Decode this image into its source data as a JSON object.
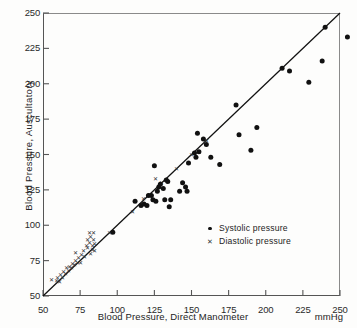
{
  "chart_data": {
    "type": "scatter",
    "title": "",
    "xlabel": "Blood Pressure, Direct Manometer",
    "ylabel": "Blood Pressure, Auscultatory",
    "units": "mmHg",
    "xlim": [
      50,
      250
    ],
    "ylim": [
      50,
      250
    ],
    "xticks": [
      50,
      75,
      100,
      125,
      150,
      175,
      200,
      225,
      250
    ],
    "yticks": [
      50,
      75,
      100,
      125,
      150,
      175,
      200,
      225,
      250
    ],
    "grid": false,
    "legend_position": "center-right",
    "reference_line": {
      "name": "identity-line",
      "from": [
        50,
        50
      ],
      "to": [
        250,
        250
      ],
      "style": "solid"
    },
    "series": [
      {
        "name": "Systolic pressure",
        "marker": "filled-circle",
        "color": "#111111",
        "points": [
          [
            97,
            95
          ],
          [
            112,
            117
          ],
          [
            116,
            114
          ],
          [
            118,
            115
          ],
          [
            120,
            114
          ],
          [
            121,
            121
          ],
          [
            123,
            121
          ],
          [
            124,
            118
          ],
          [
            125,
            142
          ],
          [
            126,
            117
          ],
          [
            127,
            124
          ],
          [
            128,
            127
          ],
          [
            129,
            129
          ],
          [
            131,
            126
          ],
          [
            132,
            118
          ],
          [
            133,
            132
          ],
          [
            134,
            131
          ],
          [
            135,
            113
          ],
          [
            136,
            118
          ],
          [
            142,
            124
          ],
          [
            144,
            130
          ],
          [
            146,
            127
          ],
          [
            147,
            124
          ],
          [
            148,
            144
          ],
          [
            152,
            151
          ],
          [
            153,
            148
          ],
          [
            154,
            165
          ],
          [
            155,
            152
          ],
          [
            158,
            161
          ],
          [
            160,
            157
          ],
          [
            163,
            148
          ],
          [
            169,
            143
          ],
          [
            180,
            185
          ],
          [
            182,
            164
          ],
          [
            190,
            153
          ],
          [
            194,
            169
          ],
          [
            211,
            211
          ],
          [
            216,
            209
          ],
          [
            229,
            201
          ],
          [
            238,
            216
          ],
          [
            240,
            240
          ],
          [
            255,
            233
          ]
        ]
      },
      {
        "name": "Diastolic pressure",
        "marker": "cross",
        "color": "#333333",
        "points": [
          [
            56,
            62
          ],
          [
            59,
            61
          ],
          [
            60,
            63
          ],
          [
            61,
            60
          ],
          [
            62,
            65
          ],
          [
            63,
            63
          ],
          [
            64,
            67
          ],
          [
            65,
            66
          ],
          [
            66,
            70
          ],
          [
            67,
            68
          ],
          [
            68,
            71
          ],
          [
            69,
            70
          ],
          [
            70,
            73
          ],
          [
            71,
            72
          ],
          [
            72,
            75
          ],
          [
            72,
            81
          ],
          [
            73,
            74
          ],
          [
            74,
            77
          ],
          [
            75,
            74
          ],
          [
            76,
            79
          ],
          [
            77,
            82
          ],
          [
            78,
            78
          ],
          [
            79,
            86
          ],
          [
            80,
            84
          ],
          [
            80,
            90
          ],
          [
            81,
            88
          ],
          [
            81,
            95
          ],
          [
            82,
            80
          ],
          [
            82,
            92
          ],
          [
            83,
            83
          ],
          [
            83,
            86
          ],
          [
            84,
            90
          ],
          [
            84,
            95
          ],
          [
            85,
            82
          ],
          [
            85,
            87
          ],
          [
            95,
            95
          ],
          [
            110,
            110
          ],
          [
            118,
            119
          ],
          [
            122,
            122
          ],
          [
            126,
            133
          ],
          [
            130,
            130
          ],
          [
            140,
            140
          ],
          [
            150,
            150
          ],
          [
            160,
            160
          ]
        ]
      }
    ]
  },
  "legend": {
    "items": [
      {
        "label": "Systolic pressure",
        "marker": "filled-circle"
      },
      {
        "label": "Diastolic pressure",
        "marker": "cross"
      }
    ]
  },
  "axes": {
    "x_title": "Blood Pressure, Direct Manometer",
    "x_units": "mmHg",
    "y_title": "Blood Pressure, Auscultatory"
  }
}
